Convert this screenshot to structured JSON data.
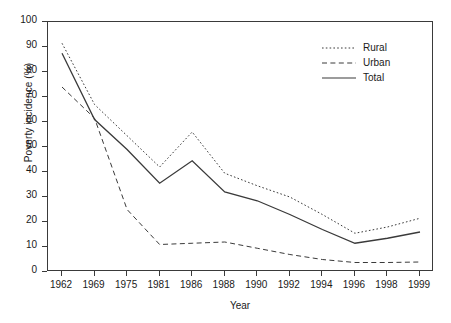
{
  "chart_data": {
    "type": "line",
    "title": "",
    "xlabel": "Year",
    "ylabel": "Poverty incidence (%)",
    "categories": [
      "1962",
      "1969",
      "1975",
      "1981",
      "1986",
      "1988",
      "1990",
      "1992",
      "1994",
      "1996",
      "1998",
      "1999"
    ],
    "ylim": [
      0,
      100
    ],
    "yticks": [
      0,
      10,
      20,
      30,
      40,
      50,
      60,
      70,
      80,
      90,
      100
    ],
    "grid": false,
    "legend_position": "top-right",
    "series": [
      {
        "name": "Rural",
        "style": "dotted",
        "values": [
          91.5,
          67.0,
          54.5,
          42.0,
          56.0,
          39.5,
          34.5,
          30.0,
          23.0,
          15.5,
          18.0,
          21.5
        ]
      },
      {
        "name": "Urban",
        "style": "dashed",
        "values": [
          74.0,
          61.5,
          25.0,
          11.0,
          11.5,
          12.0,
          9.5,
          7.0,
          5.0,
          3.8,
          3.8,
          4.0
        ]
      },
      {
        "name": "Total",
        "style": "solid",
        "values": [
          87.5,
          61.0,
          49.0,
          35.5,
          44.5,
          32.0,
          28.5,
          23.0,
          17.0,
          11.5,
          13.5,
          16.0
        ]
      }
    ]
  },
  "axis": {
    "y_title": "Poverty incidence (%)",
    "x_title": "Year"
  },
  "legend": {
    "items": [
      {
        "label": "Rural"
      },
      {
        "label": "Urban"
      },
      {
        "label": "Total"
      }
    ]
  },
  "colors": {
    "line": "#3a3a3a",
    "frame": "#3a3a3a",
    "text": "#1a1a1a",
    "background": "#ffffff"
  }
}
